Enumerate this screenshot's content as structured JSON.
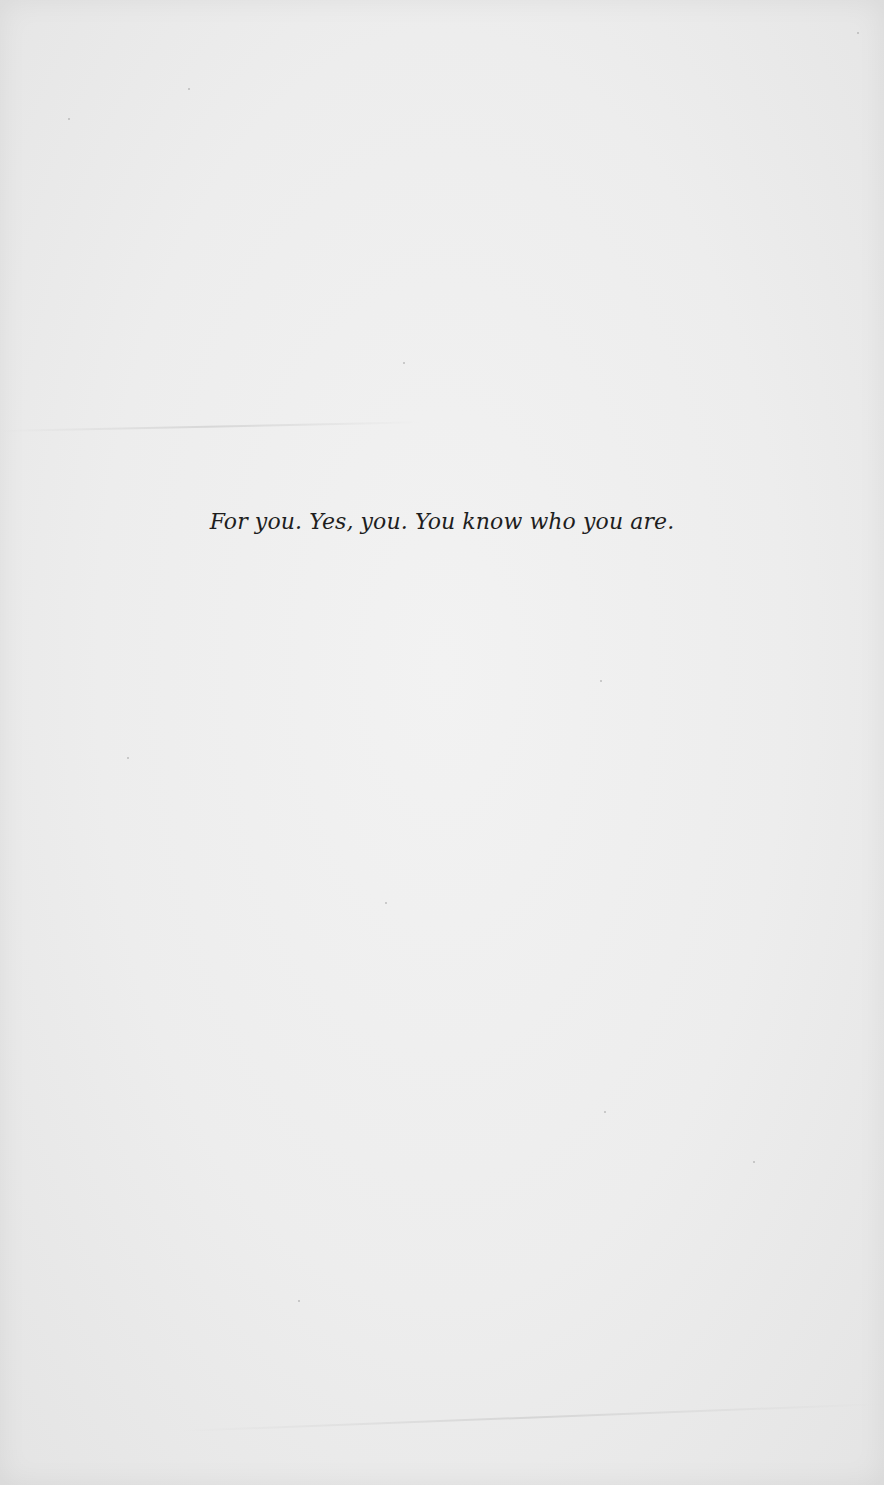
{
  "page": {
    "dedication": "For you. Yes, you. You know who you are."
  },
  "colors": {
    "paper": "#eeeeee",
    "text": "#1e1e1e"
  }
}
